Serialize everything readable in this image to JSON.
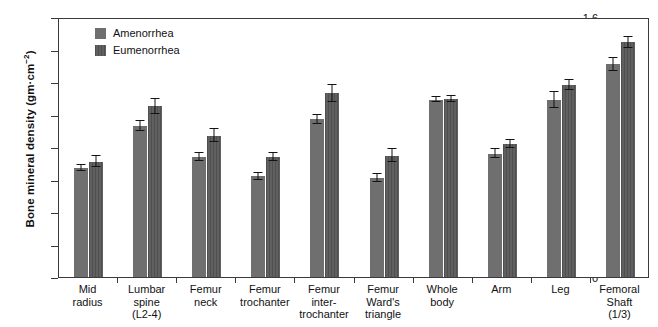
{
  "chart_data": {
    "type": "bar",
    "title": "",
    "xlabel": "",
    "ylabel": "Bone mineral density (gm·cm",
    "ylabel_sup": "−2",
    "ylabel_suffix": ")",
    "ylim": [
      0,
      1.6
    ],
    "yticks": [
      "0",
      "0.2",
      "0.4",
      "0.6",
      "0.8",
      "1",
      "1.2",
      "1.4",
      "1.6"
    ],
    "ytick_values": [
      0,
      0.2,
      0.4,
      0.6,
      0.8,
      1.0,
      1.2,
      1.4,
      1.6
    ],
    "grid": false,
    "legend_position": "top-left-inside",
    "categories": [
      "Mid\nradius",
      "Lumbar\nspine\n(L2-4)",
      "Femur\nneck",
      "Femur\ntrochanter",
      "Femur\ninter-\ntrochanter",
      "Femur\nWard's\ntriangle",
      "Whole\nbody",
      "Arm",
      "Leg",
      "Femoral\nShaft\n(1/3)"
    ],
    "series": [
      {
        "name": "Amenorrhea",
        "color": "#6f6f6f",
        "pattern": "solid",
        "values": [
          0.67,
          0.93,
          0.74,
          0.62,
          0.97,
          0.61,
          1.09,
          0.76,
          1.09,
          1.31
        ],
        "errors": [
          0.02,
          0.03,
          0.025,
          0.02,
          0.03,
          0.025,
          0.015,
          0.03,
          0.05,
          0.04
        ]
      },
      {
        "name": "Eumenorrhea",
        "color": "#585858",
        "pattern": "vertical-stripes",
        "values": [
          0.71,
          1.05,
          0.87,
          0.74,
          1.13,
          0.745,
          1.095,
          0.82,
          1.18,
          1.445
        ],
        "errors": [
          0.035,
          0.045,
          0.04,
          0.025,
          0.05,
          0.04,
          0.02,
          0.025,
          0.03,
          0.035
        ]
      }
    ]
  }
}
